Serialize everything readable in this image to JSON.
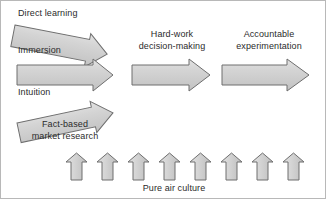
{
  "diagram": {
    "type": "process-flow",
    "title_visible": false,
    "background_color": "#ffffff",
    "arrow_fill": "#d2d2d2",
    "arrow_stroke": "#6e6e6e",
    "text_color": "#2b2b2b",
    "input_arrows": [
      {
        "id": "direct-learning",
        "heading": "Direct learning",
        "sublabel": "Immersion",
        "direction": "down-right"
      },
      {
        "id": "intuition",
        "heading": "",
        "sublabel": "Intuition",
        "direction": "right"
      },
      {
        "id": "fact-based-market-research",
        "heading": "",
        "sublabel_line1": "Fact-based",
        "sublabel_line2": "market research",
        "direction": "up-right"
      }
    ],
    "stage_arrows": [
      {
        "id": "hard-work-decision-making",
        "label_line1": "Hard-work",
        "label_line2": "decision-making",
        "direction": "right"
      },
      {
        "id": "accountable-experimentation",
        "label_line1": "Accountable",
        "label_line2": "experimentation",
        "direction": "right"
      }
    ],
    "foundation": {
      "label": "Pure air culture",
      "arrow_count": 8,
      "direction": "up"
    }
  }
}
